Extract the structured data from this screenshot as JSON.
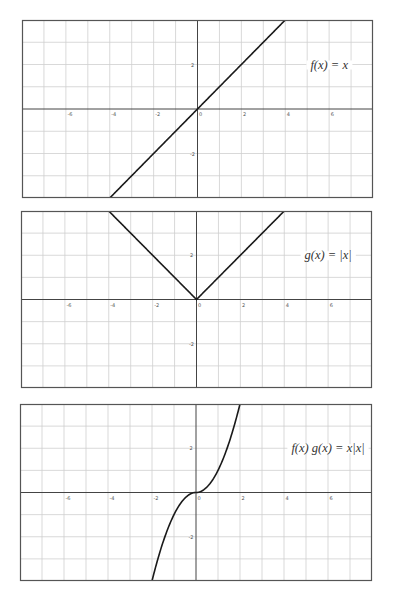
{
  "chart_data": [
    {
      "type": "line",
      "title": "",
      "label": "f(x) = x",
      "expression": "x",
      "xlim": [
        -8,
        8
      ],
      "ylim": [
        -4,
        4
      ],
      "grid": true,
      "x_ticks": [
        -6,
        -4,
        -2,
        0,
        2,
        4,
        6
      ],
      "y_ticks": [
        -2,
        2
      ],
      "x": [
        -4,
        0,
        4
      ],
      "y": [
        -4,
        0,
        4
      ],
      "label_position": {
        "x": 5,
        "y": 2
      }
    },
    {
      "type": "line",
      "title": "",
      "label": "g(x) = |x|",
      "expression": "abs(x)",
      "xlim": [
        -8,
        8
      ],
      "ylim": [
        -4,
        4
      ],
      "grid": true,
      "x_ticks": [
        -6,
        -4,
        -2,
        0,
        2,
        4,
        6
      ],
      "y_ticks": [
        -2,
        2
      ],
      "x": [
        -4,
        -2,
        0,
        2,
        4
      ],
      "y": [
        4,
        2,
        0,
        2,
        4
      ],
      "label_position": {
        "x": 5,
        "y": 2
      }
    },
    {
      "type": "line",
      "title": "",
      "label": "f(x) g(x) = x|x|",
      "expression": "x*abs(x)",
      "xlim": [
        -8,
        8
      ],
      "ylim": [
        -4,
        4
      ],
      "grid": true,
      "x_ticks": [
        -6,
        -4,
        -2,
        0,
        2,
        4,
        6
      ],
      "y_ticks": [
        -2,
        2
      ],
      "x": [
        -2,
        -1.5,
        -1,
        -0.5,
        0,
        0.5,
        1,
        1.5,
        2
      ],
      "y": [
        -4,
        -2.25,
        -1,
        -0.25,
        0,
        0.25,
        1,
        2.25,
        4
      ],
      "label_position": {
        "x": 5,
        "y": 2
      }
    }
  ],
  "plots": [
    {
      "label_main": "f(x) = x",
      "box": {
        "left": 22,
        "top": 20,
        "width": 351,
        "height": 178
      }
    },
    {
      "label_main": "g(x) = |x|",
      "box": {
        "left": 21,
        "top": 211,
        "width": 351,
        "height": 177
      }
    },
    {
      "label_main": "f(x) g(x) = x|x|",
      "box": {
        "left": 20,
        "top": 404,
        "width": 352,
        "height": 177
      }
    }
  ],
  "colors": {
    "grid": "#cfcfcf",
    "axis": "#444444",
    "frame": "#555555",
    "curve": "#1a1a1a",
    "background": "#ffffff"
  }
}
